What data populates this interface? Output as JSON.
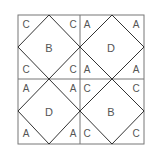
{
  "diagram": {
    "grid": {
      "rows": 2,
      "cols": 2
    },
    "cells": [
      {
        "position": "top-left",
        "center": "B",
        "corners": [
          "C",
          "C",
          "C",
          "C"
        ]
      },
      {
        "position": "top-right",
        "center": "D",
        "corners": [
          "A",
          "A",
          "A",
          "A"
        ]
      },
      {
        "position": "bottom-left",
        "center": "D",
        "corners": [
          "A",
          "A",
          "A",
          "A"
        ]
      },
      {
        "position": "bottom-right",
        "center": "B",
        "corners": [
          "C",
          "C",
          "C",
          "C"
        ]
      }
    ],
    "colors": {
      "line": "#333333",
      "text": "#555555",
      "background": "#ffffff"
    }
  }
}
